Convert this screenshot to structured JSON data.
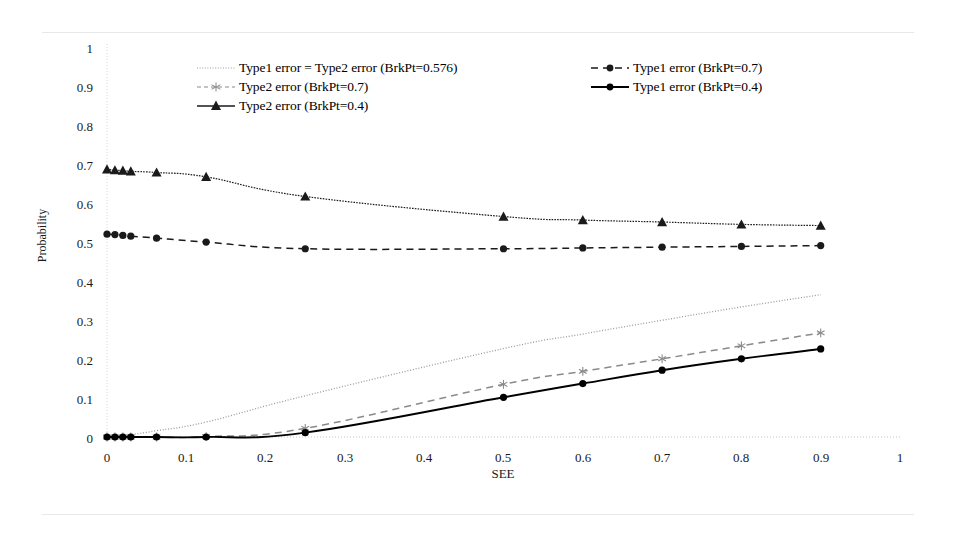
{
  "chart_data": {
    "type": "line",
    "title": "",
    "xlabel": "SEE",
    "ylabel": "Probability",
    "xlim": [
      0,
      1
    ],
    "ylim": [
      0,
      1
    ],
    "xticks": [
      "0",
      "0.1",
      "0.2",
      "0.3",
      "0.4",
      "0.5",
      "0.6",
      "0.7",
      "0.8",
      "0.9",
      "1"
    ],
    "yticks": [
      "0",
      "0.1",
      "0.2",
      "0.3",
      "0.4",
      "0.5",
      "0.6",
      "0.7",
      "0.8",
      "0.9",
      "1"
    ],
    "grid": false,
    "legend_position": "top",
    "x": [
      0,
      0.01,
      0.02,
      0.03,
      0.0625,
      0.125,
      0.25,
      0.5,
      0.6,
      0.7,
      0.8,
      0.9
    ],
    "series": [
      {
        "name": "Type1 error = Type2 error (BrkPt=0.576)",
        "marker": "none",
        "line": "dotted",
        "color": "#9a9a9a",
        "values": [
          0.0,
          0.002,
          0.004,
          0.006,
          0.016,
          0.038,
          0.105,
          0.225,
          0.262,
          0.297,
          0.331,
          0.362
        ]
      },
      {
        "name": "Type2 error (BrkPt=0.7)",
        "marker": "star",
        "line": "dashed",
        "color": "#8a8a8a",
        "values": [
          0.0,
          0.0,
          0.0,
          0.0,
          0.0,
          0.001,
          0.022,
          0.134,
          0.167,
          0.199,
          0.232,
          0.265
        ]
      },
      {
        "name": "Type2 error (BrkPt=0.4)",
        "marker": "triangle",
        "line": "dotted-solid",
        "color": "#1a1a1a",
        "values": [
          0.681,
          0.679,
          0.678,
          0.676,
          0.673,
          0.662,
          0.612,
          0.561,
          0.552,
          0.547,
          0.541,
          0.538
        ]
      },
      {
        "name": "Type1 error (BrkPt=0.7)",
        "marker": "circle",
        "line": "dashed",
        "color": "#1a1a1a",
        "values": [
          0.516,
          0.515,
          0.513,
          0.511,
          0.506,
          0.496,
          0.479,
          0.479,
          0.481,
          0.483,
          0.485,
          0.487
        ]
      },
      {
        "name": "Type1 error (BrkPt=0.4)",
        "marker": "circle",
        "line": "solid",
        "color": "#000000",
        "values": [
          0.0,
          0.0,
          0.0,
          0.0,
          0.0,
          0.0,
          0.011,
          0.101,
          0.136,
          0.17,
          0.199,
          0.224
        ]
      }
    ]
  },
  "legend": {
    "left_entries": [
      {
        "label": "Type1 error = Type2 error (BrkPt=0.576)",
        "key": "dotted-line-key"
      },
      {
        "label": "Type2 error (BrkPt=0.7)",
        "key": "dashed-star-key"
      },
      {
        "label": "Type2 error (BrkPt=0.4)",
        "key": "solid-triangle-key"
      }
    ],
    "right_entries": [
      {
        "label": "Type1 error (BrkPt=0.7)",
        "key": "dashed-circle-key"
      },
      {
        "label": "Type1 error (BrkPt=0.4)",
        "key": "solid-circle-key"
      }
    ]
  }
}
